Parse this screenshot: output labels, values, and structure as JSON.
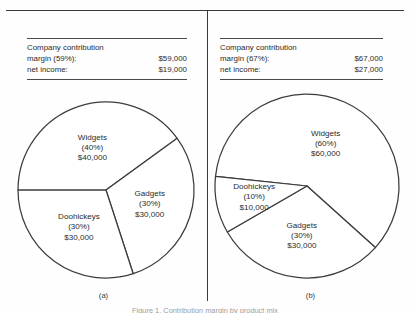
{
  "figure": {
    "caption": "Figure 1. Contribution margin by product mix",
    "panels": [
      {
        "id": "a",
        "caption_label": "(a)",
        "summary": {
          "heading": "Company contribution",
          "rows": [
            {
              "label": "margin (59%):",
              "value": "$59,000"
            },
            {
              "label": "net income:",
              "value": "$19,000"
            }
          ]
        }
      },
      {
        "id": "b",
        "caption_label": "(b)",
        "summary": {
          "heading": "Company contribution",
          "rows": [
            {
              "label": "margin (67%):",
              "value": "$67,000"
            },
            {
              "label": "net income:",
              "value": "$27,000"
            }
          ]
        }
      }
    ]
  },
  "chart_data": [
    {
      "type": "pie",
      "id": "a",
      "title": "(a)",
      "categories": [
        "Widgets",
        "Gadgets",
        "Doohickeys"
      ],
      "values": [
        40,
        30,
        30
      ],
      "value_labels": [
        "$40,000",
        "$30,000",
        "$30,000"
      ],
      "percent_labels": [
        "(40%)",
        "(30%)",
        "(30%)"
      ],
      "start_angle_deg": 180,
      "direction": "clockwise",
      "legend": "none",
      "grid": false,
      "slice_fill": "#ffffff",
      "slice_stroke": "#3c3c3c"
    },
    {
      "type": "pie",
      "id": "b",
      "title": "(b)",
      "categories": [
        "Widgets",
        "Gadgets",
        "Doohickeys"
      ],
      "values": [
        60,
        30,
        10
      ],
      "value_labels": [
        "$60,000",
        "$30,000",
        "$10,000"
      ],
      "percent_labels": [
        "(60%)",
        "(30%)",
        "(10%)"
      ],
      "start_angle_deg": 186,
      "direction": "clockwise",
      "legend": "none",
      "grid": false,
      "slice_fill": "#ffffff",
      "slice_stroke": "#3c3c3c"
    }
  ]
}
